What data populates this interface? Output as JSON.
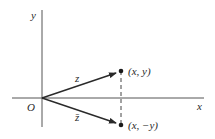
{
  "diagram": {
    "colors": {
      "background": "#ffffff",
      "stroke": "#2a2a2a",
      "axis": "#555555"
    },
    "axes": {
      "x_label": "x",
      "y_label": "y",
      "origin_label": "O"
    },
    "vectors": [
      {
        "label": "z",
        "from": "O",
        "to": "(x, y)"
      },
      {
        "label": "z̄",
        "from": "O",
        "to": "(x, −y)"
      }
    ],
    "points": [
      {
        "label": "(x, y)"
      },
      {
        "label": "(x, −y)"
      }
    ],
    "dashed_connector": {
      "from": "(x, y)",
      "to": "(x, −y)"
    }
  }
}
